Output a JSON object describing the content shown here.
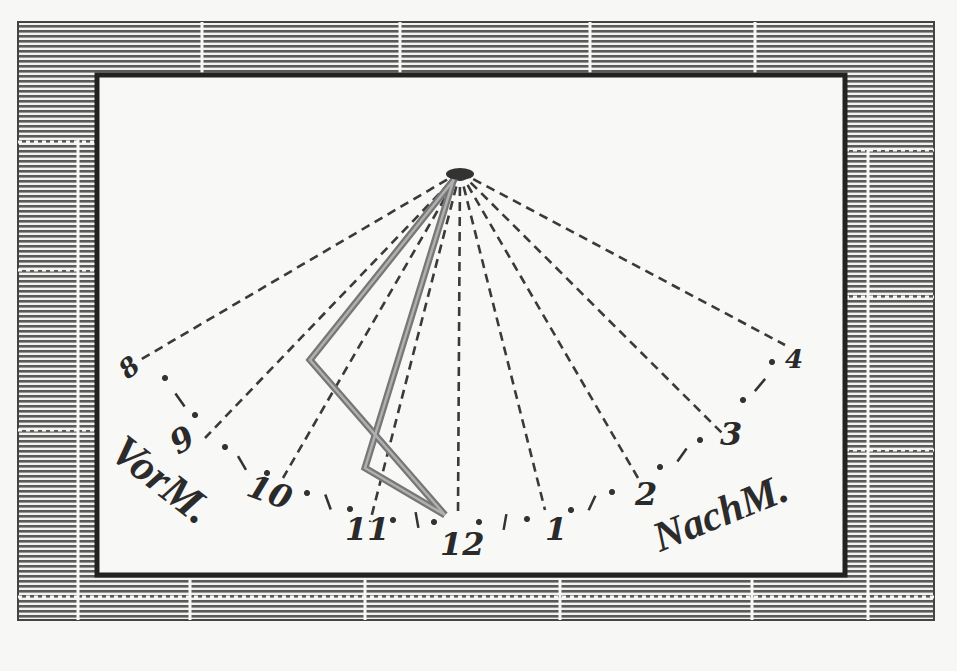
{
  "figure": {
    "type": "sundial-engraving",
    "colors": {
      "paper": "#f7f7f5",
      "ink": "#2a2a2a",
      "hatch": "#5a5a5a",
      "gnomon": "#7a7a7a"
    },
    "apex": {
      "x": 460,
      "y": 172
    },
    "hour_lines": [
      {
        "label": "8",
        "end": [
          140,
          360
        ],
        "label_pos": [
          128,
          380
        ],
        "rotate": -40
      },
      {
        "label": "9",
        "end": [
          205,
          438
        ],
        "label_pos": [
          178,
          455
        ],
        "rotate": -30
      },
      {
        "label": "10",
        "end": [
          283,
          478
        ],
        "label_pos": [
          245,
          495
        ],
        "rotate": 20
      },
      {
        "label": "11",
        "end": [
          370,
          522
        ],
        "label_pos": [
          345,
          540
        ],
        "rotate": 0
      },
      {
        "label": "12",
        "end": [
          458,
          513
        ],
        "label_pos": [
          440,
          555
        ],
        "rotate": 0
      },
      {
        "label": "1",
        "end": [
          545,
          510
        ],
        "label_pos": [
          545,
          540
        ],
        "rotate": 0
      },
      {
        "label": "2",
        "end": [
          638,
          478
        ],
        "label_pos": [
          635,
          505
        ],
        "rotate": 0
      },
      {
        "label": "3",
        "end": [
          722,
          433
        ],
        "label_pos": [
          720,
          445
        ],
        "rotate": 0
      },
      {
        "label": "4",
        "end": [
          785,
          345
        ],
        "label_pos": [
          785,
          368
        ],
        "rotate": 0
      }
    ],
    "gnomon": {
      "outer": [
        [
          460,
          172
        ],
        [
          310,
          360
        ],
        [
          445,
          515
        ]
      ],
      "inner": [
        [
          455,
          175
        ],
        [
          365,
          468
        ],
        [
          445,
          515
        ]
      ]
    },
    "ticks": [
      {
        "type": "dot",
        "x": 165,
        "y": 378
      },
      {
        "type": "dash",
        "x": 180,
        "y": 400,
        "angle": 55
      },
      {
        "type": "dot",
        "x": 195,
        "y": 415
      },
      {
        "type": "dot",
        "x": 225,
        "y": 447
      },
      {
        "type": "dash",
        "x": 242,
        "y": 463,
        "angle": 60
      },
      {
        "type": "dot",
        "x": 267,
        "y": 473
      },
      {
        "type": "dot",
        "x": 307,
        "y": 493
      },
      {
        "type": "dash",
        "x": 328,
        "y": 502,
        "angle": 70
      },
      {
        "type": "dot",
        "x": 350,
        "y": 509
      },
      {
        "type": "dot",
        "x": 393,
        "y": 520
      },
      {
        "type": "dash",
        "x": 417,
        "y": 520,
        "angle": 80
      },
      {
        "type": "dot",
        "x": 434,
        "y": 522
      },
      {
        "type": "dot",
        "x": 479,
        "y": 522
      },
      {
        "type": "dash",
        "x": 505,
        "y": 522,
        "angle": 100
      },
      {
        "type": "dot",
        "x": 527,
        "y": 519
      },
      {
        "type": "dot",
        "x": 571,
        "y": 510
      },
      {
        "type": "dash",
        "x": 592,
        "y": 503,
        "angle": 115
      },
      {
        "type": "dot",
        "x": 612,
        "y": 492
      },
      {
        "type": "dot",
        "x": 660,
        "y": 467
      },
      {
        "type": "dash",
        "x": 682,
        "y": 455,
        "angle": 125
      },
      {
        "type": "dot",
        "x": 700,
        "y": 440
      },
      {
        "type": "dot",
        "x": 743,
        "y": 400
      },
      {
        "type": "dash",
        "x": 760,
        "y": 385,
        "angle": 130
      },
      {
        "type": "dot",
        "x": 772,
        "y": 362
      }
    ],
    "labels": {
      "morning": "VorM.",
      "afternoon": "NachM."
    }
  }
}
